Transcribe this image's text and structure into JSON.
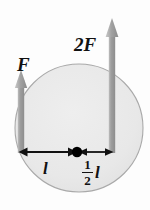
{
  "figure": {
    "background_color": "#fdfdfd",
    "disk": {
      "name": "shaded-disk",
      "fill_color": "#e9e9e9",
      "stroke_color": "#a8a8a8",
      "center_x": 79,
      "center_y": 128,
      "radius": 64
    },
    "pivot": {
      "name": "center-of-mass-dot",
      "color": "#000000",
      "x": 77,
      "y": 152,
      "radius": 5
    },
    "forces": [
      {
        "id": "force-F",
        "label": "F",
        "magnitude_text": "F",
        "direction": "up",
        "color": "#9a9a9a",
        "x": 21,
        "tail_y": 153,
        "tip_y": 71
      },
      {
        "id": "force-2F",
        "label": "2F",
        "magnitude_text": "2F",
        "direction": "up",
        "color": "#9a9a9a",
        "x": 112,
        "tail_y": 153,
        "tip_y": 19
      }
    ],
    "dimensions": [
      {
        "id": "dimension-l",
        "label": "l",
        "value_text": "l",
        "from_x": 19,
        "to_x": 77,
        "y": 152,
        "color": "#000000"
      },
      {
        "id": "dimension-half-l",
        "label": "1/2 l",
        "numerator": "1",
        "denominator": "2",
        "unit": "l",
        "from_x": 77,
        "to_x": 113,
        "y": 152,
        "color": "#000000"
      }
    ]
  }
}
